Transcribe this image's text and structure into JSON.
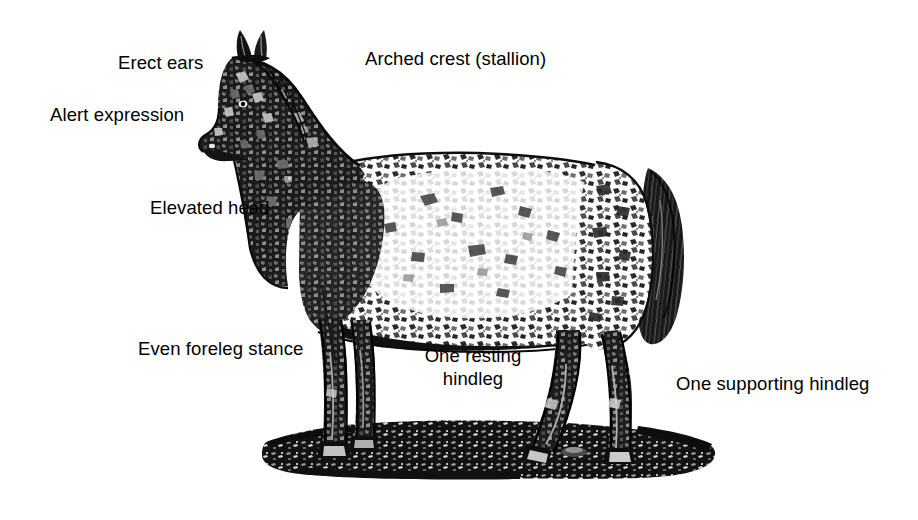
{
  "figure": {
    "background_color": "#ffffff",
    "ink_color": "#000000",
    "midtone_color": "#808080",
    "highlight_color": "#f2f2f2",
    "style": "black-and-white engraved / halftone line art",
    "ground_description": "dark textured mound of earth beneath the hooves"
  },
  "labels": [
    {
      "id": "erect-ears",
      "text": "Erect ears",
      "x": 118,
      "y": 51,
      "align": "left"
    },
    {
      "id": "arched-crest",
      "text": "Arched crest (stallion)",
      "x": 365,
      "y": 47,
      "align": "left"
    },
    {
      "id": "alert-expression",
      "text": "Alert expression",
      "x": 50,
      "y": 103,
      "align": "left"
    },
    {
      "id": "elevated-head",
      "text": "Elevated head",
      "x": 150,
      "y": 196,
      "align": "left"
    },
    {
      "id": "even-foreleg",
      "text": "Even foreleg stance",
      "x": 138,
      "y": 337,
      "align": "left"
    },
    {
      "id": "one-resting",
      "text": "One resting\nhindleg",
      "x": 417,
      "y": 344,
      "align": "center"
    },
    {
      "id": "one-supporting",
      "text": "One supporting hindleg",
      "x": 676,
      "y": 372,
      "align": "left"
    }
  ]
}
